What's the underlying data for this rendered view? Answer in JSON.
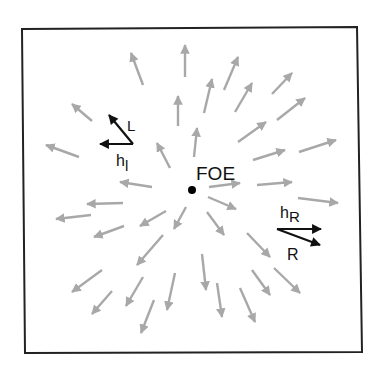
{
  "diagram": {
    "foe": {
      "label": "FOE",
      "x": 192,
      "y": 190
    },
    "colors": {
      "flow_arrow": "#a8a8a8",
      "vector_arrow": "#111111",
      "frame": "#222222",
      "background": "#ffffff"
    },
    "frame": {
      "points": "22,29 357,27 362,352 25,353"
    },
    "flow_vectors": [
      {
        "x1": 143,
        "y1": 85,
        "x2": 131,
        "y2": 53
      },
      {
        "x1": 185,
        "y1": 77,
        "x2": 185,
        "y2": 45
      },
      {
        "x1": 204,
        "y1": 113,
        "x2": 212,
        "y2": 79
      },
      {
        "x1": 224,
        "y1": 90,
        "x2": 238,
        "y2": 57
      },
      {
        "x1": 235,
        "y1": 112,
        "x2": 252,
        "y2": 83
      },
      {
        "x1": 272,
        "y1": 94,
        "x2": 292,
        "y2": 73
      },
      {
        "x1": 277,
        "y1": 120,
        "x2": 305,
        "y2": 98
      },
      {
        "x1": 238,
        "y1": 142,
        "x2": 266,
        "y2": 122
      },
      {
        "x1": 178,
        "y1": 126,
        "x2": 178,
        "y2": 96
      },
      {
        "x1": 194,
        "y1": 157,
        "x2": 197,
        "y2": 128
      },
      {
        "x1": 92,
        "y1": 121,
        "x2": 72,
        "y2": 104
      },
      {
        "x1": 79,
        "y1": 157,
        "x2": 46,
        "y2": 145
      },
      {
        "x1": 170,
        "y1": 168,
        "x2": 157,
        "y2": 143
      },
      {
        "x1": 152,
        "y1": 187,
        "x2": 120,
        "y2": 182
      },
      {
        "x1": 123,
        "y1": 203,
        "x2": 87,
        "y2": 204
      },
      {
        "x1": 91,
        "y1": 215,
        "x2": 56,
        "y2": 219
      },
      {
        "x1": 166,
        "y1": 211,
        "x2": 140,
        "y2": 226
      },
      {
        "x1": 186,
        "y1": 207,
        "x2": 174,
        "y2": 229
      },
      {
        "x1": 124,
        "y1": 226,
        "x2": 94,
        "y2": 237
      },
      {
        "x1": 163,
        "y1": 235,
        "x2": 137,
        "y2": 265
      },
      {
        "x1": 102,
        "y1": 270,
        "x2": 72,
        "y2": 292
      },
      {
        "x1": 112,
        "y1": 291,
        "x2": 92,
        "y2": 314
      },
      {
        "x1": 143,
        "y1": 277,
        "x2": 126,
        "y2": 306
      },
      {
        "x1": 175,
        "y1": 273,
        "x2": 167,
        "y2": 310
      },
      {
        "x1": 154,
        "y1": 300,
        "x2": 141,
        "y2": 333
      },
      {
        "x1": 202,
        "y1": 254,
        "x2": 206,
        "y2": 290
      },
      {
        "x1": 217,
        "y1": 283,
        "x2": 222,
        "y2": 317
      },
      {
        "x1": 240,
        "y1": 288,
        "x2": 255,
        "y2": 322
      },
      {
        "x1": 252,
        "y1": 270,
        "x2": 270,
        "y2": 295
      },
      {
        "x1": 274,
        "y1": 268,
        "x2": 300,
        "y2": 293
      },
      {
        "x1": 247,
        "y1": 233,
        "x2": 270,
        "y2": 257
      },
      {
        "x1": 207,
        "y1": 212,
        "x2": 224,
        "y2": 235
      },
      {
        "x1": 208,
        "y1": 197,
        "x2": 236,
        "y2": 209
      },
      {
        "x1": 209,
        "y1": 187,
        "x2": 240,
        "y2": 183
      },
      {
        "x1": 257,
        "y1": 185,
        "x2": 292,
        "y2": 182
      },
      {
        "x1": 253,
        "y1": 160,
        "x2": 285,
        "y2": 150
      },
      {
        "x1": 299,
        "y1": 152,
        "x2": 336,
        "y2": 140
      },
      {
        "x1": 298,
        "y1": 198,
        "x2": 338,
        "y2": 203
      }
    ],
    "left_vectors": {
      "L": {
        "label": "L",
        "x1": 133,
        "y1": 144,
        "x2": 109,
        "y2": 115,
        "label_x": 127,
        "label_y": 131
      },
      "h_l": {
        "label": "h",
        "subscript": "l",
        "x1": 133,
        "y1": 144,
        "x2": 100,
        "y2": 144,
        "label_x": 116,
        "label_y": 166
      }
    },
    "right_vectors": {
      "h_R": {
        "label": "h",
        "subscript": "R",
        "x1": 277,
        "y1": 229,
        "x2": 321,
        "y2": 229,
        "label_x": 280,
        "label_y": 218
      },
      "R": {
        "label": "R",
        "x1": 277,
        "y1": 229,
        "x2": 320,
        "y2": 245,
        "label_x": 287,
        "label_y": 260
      }
    }
  }
}
